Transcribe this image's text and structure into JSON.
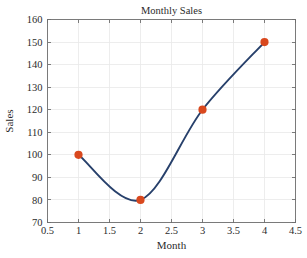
{
  "chart_data": {
    "type": "line",
    "title": "Monthly Sales",
    "xlabel": "Month",
    "ylabel": "Sales",
    "x": [
      1,
      2,
      3,
      4
    ],
    "values": [
      100,
      80,
      120,
      150
    ],
    "series": [
      {
        "name": "Sales",
        "x": [
          1,
          2,
          3,
          4
        ],
        "values": [
          100,
          80,
          120,
          150
        ]
      }
    ],
    "interpolation": "spline",
    "xlim": [
      0.5,
      4.5
    ],
    "ylim": [
      70,
      160
    ],
    "xticks": [
      0.5,
      1,
      1.5,
      2,
      2.5,
      3,
      3.5,
      4,
      4.5
    ],
    "xticklabels": [
      "0.5",
      "1",
      "1.5",
      "2",
      "2.5",
      "3",
      "3.5",
      "4",
      "4.5"
    ],
    "yticks": [
      70,
      80,
      90,
      100,
      110,
      120,
      130,
      140,
      150,
      160
    ],
    "yticklabels": [
      "70",
      "80",
      "90",
      "100",
      "110",
      "120",
      "130",
      "140",
      "150",
      "160"
    ],
    "grid": true,
    "legend": false,
    "line_color": "#27406b",
    "marker_color": "#d9481e",
    "marker_shape": "circle",
    "grid_color": "#e9e9e9",
    "axis_color": "#6e6e6e",
    "background_color": "#ffffff",
    "curve_minimum": {
      "x": 1.72,
      "y": 76
    }
  }
}
